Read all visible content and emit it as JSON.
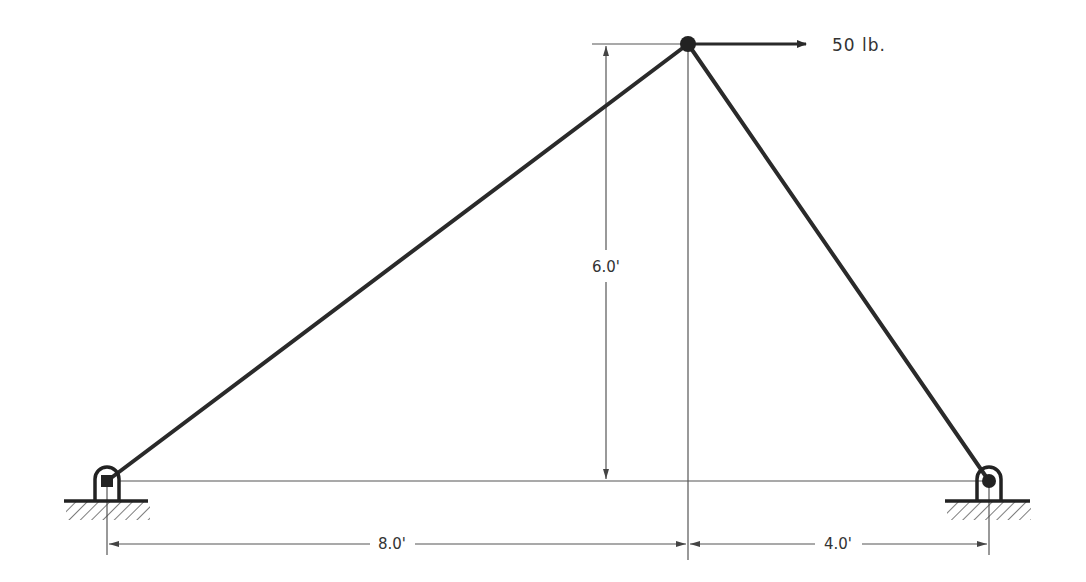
{
  "diagram": {
    "type": "two-member truss (A-frame) with pinned supports",
    "colors": {
      "member": "#2a2a2a",
      "dimension_line": "#555555",
      "text": "#333333",
      "background": "#ffffff"
    },
    "nodes": {
      "left_support": {
        "label": "",
        "type": "pin"
      },
      "apex": {
        "label": "",
        "type": "joint"
      },
      "right_support": {
        "label": "",
        "type": "pin"
      }
    },
    "load": {
      "label": "50 lb.",
      "direction": "right",
      "applied_at": "apex"
    },
    "dimensions": {
      "height": "6.0'",
      "left_span": "8.0'",
      "right_span": "4.0'"
    }
  }
}
